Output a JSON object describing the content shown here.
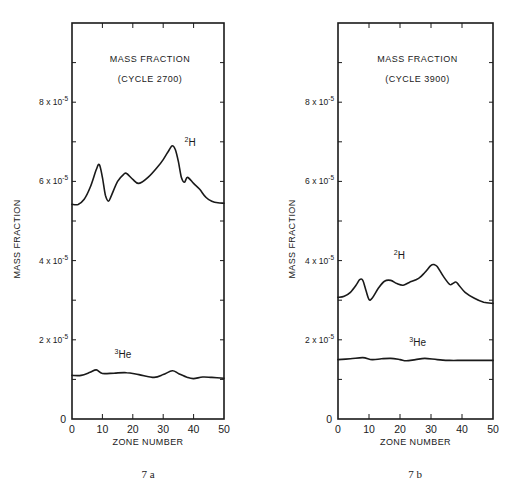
{
  "figure": {
    "panels": [
      "7 a",
      "7 b"
    ]
  },
  "chart_data": [
    {
      "type": "line",
      "panel_label": "7 a",
      "title": "MASS FRACTION",
      "subtitle": "(CYCLE 2700)",
      "xlabel": "ZONE NUMBER",
      "ylabel": "MASS FRACTION",
      "xlim": [
        0,
        50
      ],
      "ylim": [
        0,
        10
      ],
      "y_scale_note": "x10^-5",
      "x_ticks": [
        "0",
        "10",
        "20",
        "30",
        "40",
        "50"
      ],
      "y_ticks": [
        {
          "value": 0,
          "label": "0"
        },
        {
          "value": 2,
          "label": "2 x 10⁻⁵"
        },
        {
          "value": 4,
          "label": "4 x 10⁻⁵"
        },
        {
          "value": 6,
          "label": "6 x 10⁻⁵"
        },
        {
          "value": 8,
          "label": "8 x 10⁻⁵"
        }
      ],
      "grid": false,
      "series": [
        {
          "name": "²H",
          "x": [
            0,
            2,
            4,
            6,
            8,
            9,
            10,
            11,
            12,
            13,
            15,
            17,
            18,
            20,
            22,
            25,
            28,
            30,
            32,
            33,
            34,
            35,
            36,
            37,
            38,
            40,
            42,
            44,
            46,
            48,
            50
          ],
          "values": [
            5.42,
            5.42,
            5.55,
            5.85,
            6.3,
            6.42,
            6.1,
            5.65,
            5.5,
            5.65,
            6.0,
            6.18,
            6.2,
            6.05,
            5.95,
            6.1,
            6.35,
            6.55,
            6.8,
            6.9,
            6.8,
            6.5,
            6.1,
            5.98,
            6.1,
            5.95,
            5.8,
            5.6,
            5.5,
            5.46,
            5.45
          ]
        },
        {
          "name": "³He",
          "x": [
            0,
            3,
            6,
            8,
            10,
            14,
            18,
            22,
            27,
            30,
            33,
            35,
            38,
            40,
            43,
            46,
            50
          ],
          "values": [
            1.1,
            1.1,
            1.18,
            1.24,
            1.15,
            1.16,
            1.17,
            1.12,
            1.05,
            1.12,
            1.22,
            1.15,
            1.05,
            1.02,
            1.06,
            1.05,
            1.03
          ]
        }
      ],
      "annotations": [
        {
          "text": "²H",
          "x": 37,
          "y": 6.9
        },
        {
          "text": "³He",
          "x": 14,
          "y": 1.55
        }
      ]
    },
    {
      "type": "line",
      "panel_label": "7 b",
      "title": "MASS FRACTION",
      "subtitle": "(CYCLE 3900)",
      "xlabel": "ZONE NUMBER",
      "ylabel": "MASS FRACTION",
      "xlim": [
        0,
        50
      ],
      "ylim": [
        0,
        10
      ],
      "y_scale_note": "x10^-5",
      "x_ticks": [
        "0",
        "10",
        "20",
        "30",
        "40",
        "50"
      ],
      "y_ticks": [
        {
          "value": 0,
          "label": "0"
        },
        {
          "value": 2,
          "label": "2 x 10⁻⁵"
        },
        {
          "value": 4,
          "label": "4 x 10⁻⁵"
        },
        {
          "value": 6,
          "label": "6 x 10⁻⁵"
        },
        {
          "value": 8,
          "label": "8 x 10⁻⁵"
        }
      ],
      "grid": false,
      "series": [
        {
          "name": "²H",
          "x": [
            0,
            2,
            4,
            6,
            7,
            8,
            9,
            10,
            11,
            13,
            15,
            17,
            19,
            21,
            23,
            26,
            28,
            30,
            31,
            32,
            34,
            36,
            37,
            38,
            39,
            41,
            44,
            47,
            50
          ],
          "values": [
            3.07,
            3.1,
            3.2,
            3.4,
            3.52,
            3.5,
            3.25,
            3.02,
            3.05,
            3.3,
            3.48,
            3.5,
            3.42,
            3.38,
            3.45,
            3.55,
            3.7,
            3.88,
            3.9,
            3.85,
            3.6,
            3.4,
            3.42,
            3.46,
            3.38,
            3.2,
            3.05,
            2.95,
            2.92
          ]
        },
        {
          "name": "³He",
          "x": [
            0,
            4,
            8,
            11,
            14,
            17,
            20,
            22,
            25,
            28,
            32,
            36,
            40,
            45,
            50
          ],
          "values": [
            1.5,
            1.52,
            1.55,
            1.5,
            1.52,
            1.53,
            1.5,
            1.47,
            1.5,
            1.53,
            1.5,
            1.48,
            1.48,
            1.48,
            1.48
          ]
        }
      ],
      "annotations": [
        {
          "text": "²H",
          "x": 18,
          "y": 4.05
        },
        {
          "text": "³He",
          "x": 23,
          "y": 1.85
        }
      ]
    }
  ]
}
